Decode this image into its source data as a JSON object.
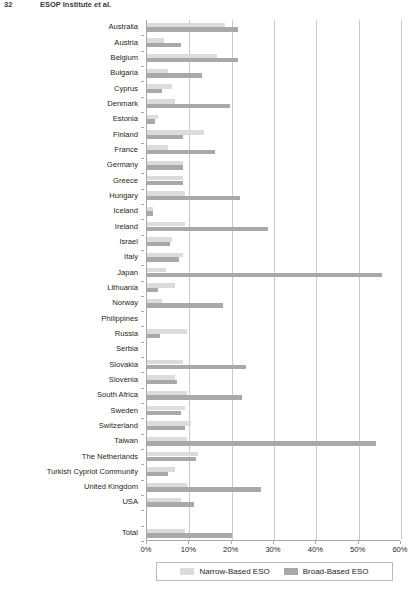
{
  "running_head": {
    "folio": "32",
    "title": "ESOP Institute et al."
  },
  "chart_data": {
    "type": "bar",
    "orientation": "horizontal",
    "title": "",
    "xlabel": "",
    "ylabel": "",
    "xlim": [
      0,
      60
    ],
    "xticks": [
      "0%",
      "10%",
      "20%",
      "30%",
      "40%",
      "50%",
      "60%"
    ],
    "xtick_values": [
      0,
      10,
      20,
      30,
      40,
      50,
      60
    ],
    "grid": true,
    "grid_axis": "x",
    "legend_position": "bottom",
    "colors": {
      "narrow": "#dcdcdc",
      "broad": "#a9a9a9",
      "axis": "#a8a8a8",
      "grid": "#c9c9c9"
    },
    "categories": [
      "Australia",
      "Austria",
      "Belgium",
      "Bulgaria",
      "Cyprus",
      "Denmark",
      "Estonia",
      "Finland",
      "France",
      "Germany",
      "Greece",
      "Hungary",
      "Iceland",
      "Ireland",
      "Israel",
      "Italy",
      "Japan",
      "Lithuania",
      "Norway",
      "Philippines",
      "Russia",
      "Serbia",
      "Slovakia",
      "Slovenia",
      "South Africa",
      "Sweden",
      "Switzerland",
      "Taiwan",
      "The Netherlands",
      "Turkish Cypriot Community",
      "United Kingdom",
      "USA",
      "",
      "Total"
    ],
    "series": [
      {
        "name": "Narrow-Based ESO",
        "key": "narrow",
        "values": [
          18.5,
          4.0,
          16.5,
          5.0,
          6.0,
          6.5,
          2.5,
          13.5,
          5.0,
          8.5,
          8.5,
          9.0,
          1.5,
          9.0,
          6.0,
          8.5,
          4.5,
          6.5,
          3.5,
          0.0,
          9.5,
          0.0,
          8.5,
          6.5,
          9.5,
          9.0,
          10.5,
          9.5,
          12.0,
          6.5,
          9.5,
          8.0,
          0.0,
          9.0
        ]
      },
      {
        "name": "Broad-Based ESO",
        "key": "broad",
        "values": [
          21.5,
          8.0,
          21.5,
          13.0,
          3.5,
          19.5,
          2.0,
          8.5,
          16.0,
          8.5,
          8.5,
          22.0,
          1.5,
          28.5,
          5.5,
          7.5,
          55.5,
          2.5,
          18.0,
          0.0,
          3.0,
          0.0,
          23.5,
          7.0,
          22.5,
          8.0,
          9.0,
          54.0,
          11.5,
          5.0,
          27.0,
          11.0,
          0.0,
          20.0
        ]
      }
    ],
    "legend": [
      {
        "label": "Narrow-Based ESO",
        "key": "narrow"
      },
      {
        "label": "Broad-Based ESO",
        "key": "broad"
      }
    ]
  }
}
